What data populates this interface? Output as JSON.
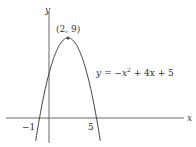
{
  "chart_data": {
    "type": "line",
    "title": "",
    "equation_label": "y = −x² + 4x + 5",
    "xlabel": "x",
    "ylabel": "y",
    "x_ticks": [
      {
        "value": -1,
        "label": "−1"
      },
      {
        "value": 5,
        "label": "5"
      }
    ],
    "annotations": [
      {
        "x": 2,
        "y": 9,
        "label": "(2, 9)"
      }
    ],
    "series": [
      {
        "name": "y = -x^2 + 4x + 5",
        "function": "-x^2+4x+5",
        "x": [
          -1.4,
          -1,
          0,
          1,
          2,
          3,
          4,
          5,
          5.4
        ],
        "values": [
          -2.56,
          0,
          5,
          8,
          9,
          8,
          5,
          0,
          -2.56
        ]
      }
    ],
    "xlim": [
      -4.5,
      15
    ],
    "ylim": [
      -3,
      10.5
    ],
    "grid": false,
    "colors": {
      "curve": "#444444",
      "axes": "#555555"
    }
  },
  "labels": {
    "x_axis": "x",
    "y_axis": "y",
    "vertex": "(2, 9)",
    "equation_main": "y = −x",
    "equation_sup": "2",
    "equation_rest": " + 4x + 5",
    "tick_neg1": "−1",
    "tick_5": "5"
  }
}
